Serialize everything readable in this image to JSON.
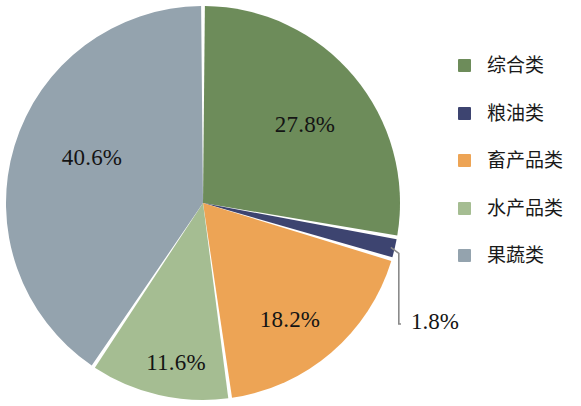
{
  "chart_data": {
    "type": "pie",
    "title": "",
    "subtitle": "",
    "xlabel": "",
    "ylabel": "",
    "unit": "%",
    "legend_position": "right",
    "grid": false,
    "start_angle_deg": 0,
    "direction": "clockwise",
    "categories": [
      "综合类",
      "粮油类",
      "畜产品类",
      "水产品类",
      "果蔬类"
    ],
    "values": [
      27.8,
      1.8,
      18.2,
      11.6,
      40.6
    ],
    "colors": [
      "#6d8c5a",
      "#3d4470",
      "#eda455",
      "#a5bd92",
      "#94a3ae"
    ],
    "slices": [
      {
        "label": "综合类",
        "value": 27.8,
        "display": "27.8%",
        "color": "#6d8c5a",
        "start_deg": 0,
        "end_deg": 100.08,
        "label_placement": "inside",
        "label_x": 305,
        "label_y": 127
      },
      {
        "label": "粮油类",
        "value": 1.8,
        "display": "1.8%",
        "color": "#3d4470",
        "start_deg": 100.08,
        "end_deg": 106.56,
        "label_placement": "callout",
        "label_x": 411,
        "label_y": 324
      },
      {
        "label": "畜产品类",
        "value": 18.2,
        "display": "18.2%",
        "color": "#eda455",
        "start_deg": 106.56,
        "end_deg": 172.08,
        "label_placement": "inside",
        "label_x": 290,
        "label_y": 322
      },
      {
        "label": "水产品类",
        "value": 11.6,
        "display": "11.6%",
        "color": "#a5bd92",
        "start_deg": 172.08,
        "end_deg": 213.84,
        "label_placement": "inside",
        "label_x": 176,
        "label_y": 365
      },
      {
        "label": "果蔬类",
        "value": 40.6,
        "display": "40.6%",
        "color": "#94a3ae",
        "start_deg": 213.84,
        "end_deg": 360,
        "label_placement": "inside",
        "label_x": 92,
        "label_y": 160
      }
    ]
  },
  "legend": {
    "items": [
      {
        "label": "综合类",
        "color": "#6d8c5a"
      },
      {
        "label": "粮油类",
        "color": "#3d4470"
      },
      {
        "label": "畜产品类",
        "color": "#eda455"
      },
      {
        "label": "水产品类",
        "color": "#a5bd92"
      },
      {
        "label": "果蔬类",
        "color": "#94a3ae"
      }
    ]
  },
  "geometry": {
    "center_x": 203,
    "center_y": 203,
    "radius": 197,
    "gap_deg": 1.1,
    "background": "#ffffff",
    "separator_color": "#ffffff",
    "leader_color": "#8a8a8a"
  }
}
